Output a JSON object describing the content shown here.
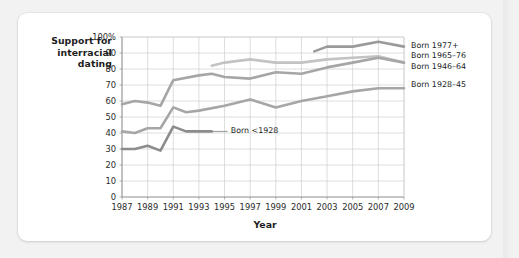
{
  "figure": {
    "y_axis_title": [
      "Support for",
      "interracial",
      "dating"
    ],
    "x_axis_title": "Year"
  },
  "chart_data": {
    "type": "line",
    "title": "",
    "subtitle": "",
    "xlabel": "Year",
    "ylabel": "Support for interracial dating",
    "xlim": [
      1987,
      2009
    ],
    "ylim": [
      0,
      100
    ],
    "grid": true,
    "legend_position": "right-inline-labels",
    "y_ticks": [
      "0",
      "10",
      "20",
      "30",
      "40",
      "50",
      "60",
      "70",
      "80",
      "90",
      "100%"
    ],
    "y_tick_values": [
      0,
      10,
      20,
      30,
      40,
      50,
      60,
      70,
      80,
      90,
      100
    ],
    "x_ticks": [
      "1987",
      "1989",
      "1991",
      "1993",
      "1995",
      "1997",
      "1999",
      "2001",
      "2003",
      "2005",
      "2007",
      "2009"
    ],
    "x_tick_values": [
      1987,
      1989,
      1991,
      1993,
      1995,
      1997,
      1999,
      2001,
      2003,
      2005,
      2007,
      2009
    ],
    "series": [
      {
        "name": "Born 1977+",
        "label": "Born 1977+",
        "color": "#9a9a9a",
        "label_y_pct": 94,
        "x": [
          2002,
          2003,
          2005,
          2007,
          2009
        ],
        "values": [
          91,
          94,
          94,
          97,
          94
        ]
      },
      {
        "name": "Born 1965–76",
        "label": "Born 1965–76",
        "color": "#c3c3c3",
        "label_y_pct": 88,
        "x": [
          1994,
          1995,
          1997,
          1999,
          2001,
          2003,
          2005,
          2007,
          2009
        ],
        "values": [
          82,
          84,
          86,
          84,
          84,
          86,
          87,
          88,
          84
        ]
      },
      {
        "name": "Born 1946–64",
        "label": "Born 1946–64",
        "color": "#a6a6a6",
        "label_y_pct": 81,
        "x": [
          1987,
          1988,
          1989,
          1990,
          1991,
          1993,
          1994,
          1995,
          1997,
          1999,
          2001,
          2003,
          2005,
          2007,
          2009
        ],
        "values": [
          58,
          60,
          59,
          57,
          73,
          76,
          77,
          75,
          74,
          78,
          77,
          81,
          84,
          87,
          84
        ]
      },
      {
        "name": "Born 1928–45",
        "label": "Born 1928–45",
        "color": "#a6a6a6",
        "label_y_pct": 70,
        "x": [
          1987,
          1988,
          1989,
          1990,
          1991,
          1992,
          1993,
          1995,
          1997,
          1999,
          2001,
          2003,
          2005,
          2007,
          2009
        ],
        "values": [
          41,
          40,
          43,
          43,
          56,
          53,
          54,
          57,
          61,
          56,
          60,
          63,
          66,
          68,
          68
        ]
      },
      {
        "name": "Born <1928",
        "label": "Born <1928",
        "color": "#8c8c8c",
        "label_y_pct": 41,
        "x": [
          1987,
          1988,
          1989,
          1990,
          1991,
          1992,
          1993,
          1994
        ],
        "values": [
          30,
          30,
          32,
          29,
          44,
          41,
          41,
          41
        ]
      }
    ]
  }
}
